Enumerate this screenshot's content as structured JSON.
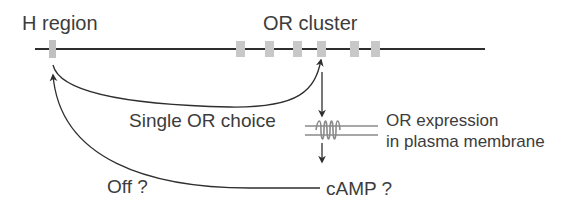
{
  "labels": {
    "h_region": "H region",
    "or_cluster": "OR cluster",
    "single_or_choice": "Single OR choice",
    "or_expression_line1": "OR expression",
    "or_expression_line2": "in plasma membrane",
    "off": "Off ?",
    "camp": "cAMP ?"
  },
  "colors": {
    "line": "#2e2e2e",
    "box": "#c8c8c8",
    "membrane": "#8a8a8a",
    "text": "#3c3c3c"
  },
  "diagram": {
    "chromosome": {
      "x1": 35,
      "x2": 485,
      "y": 49
    },
    "h_region_box": {
      "x": 52,
      "label_ref": "labels.h_region"
    },
    "or_boxes_x": [
      240,
      269,
      297,
      322,
      353,
      374
    ],
    "selected_or_index": 3
  }
}
